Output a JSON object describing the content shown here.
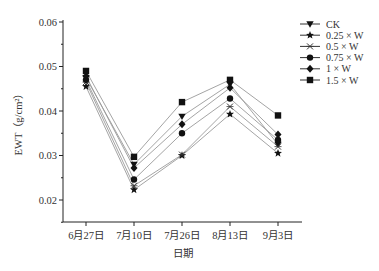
{
  "chart_data": {
    "type": "line",
    "title": "",
    "xlabel": "日期",
    "ylabel": "EWT（g/cm²）",
    "ylim": [
      0.015,
      0.06
    ],
    "yticks": [
      0.02,
      0.03,
      0.04,
      0.05,
      0.06
    ],
    "ytick_labels": [
      "0.02",
      "0.03",
      "0.04",
      "0.05",
      "0.06"
    ],
    "categories": [
      "6月27日",
      "7月10日",
      "7月26日",
      "8月13日",
      "9月3日"
    ],
    "grid": false,
    "legend_position": "upper right, outside plot",
    "series": [
      {
        "name": "CK",
        "marker": "triangle-down",
        "values": [
          0.0475,
          0.028,
          0.0388,
          0.046,
          0.0325
        ]
      },
      {
        "name": "0.25 × W",
        "marker": "star",
        "values": [
          0.0455,
          0.0223,
          0.03,
          0.0393,
          0.0305
        ]
      },
      {
        "name": "0.5 × W",
        "marker": "x-cross",
        "values": [
          0.0465,
          0.0232,
          0.0302,
          0.041,
          0.032
        ]
      },
      {
        "name": "0.75 × W",
        "marker": "circle",
        "values": [
          0.047,
          0.0246,
          0.035,
          0.0428,
          0.0335
        ]
      },
      {
        "name": "1 × W",
        "marker": "diamond",
        "values": [
          0.0478,
          0.0272,
          0.037,
          0.0452,
          0.0347
        ]
      },
      {
        "name": "1.5 × W",
        "marker": "square",
        "values": [
          0.049,
          0.0297,
          0.042,
          0.047,
          0.039
        ]
      }
    ]
  }
}
